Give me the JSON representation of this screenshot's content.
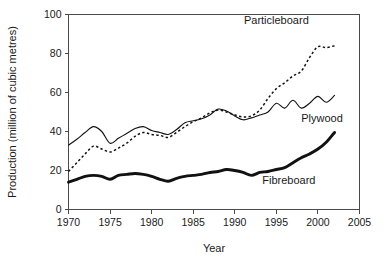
{
  "chart_data": {
    "type": "line",
    "title": "",
    "xlabel": "Year",
    "ylabel": "Production (million of cubic metres)",
    "xlim": [
      1970,
      2005
    ],
    "ylim": [
      0,
      100
    ],
    "grid": false,
    "legend_position": "inline-annotations",
    "xticks": [
      1970,
      1975,
      1980,
      1985,
      1990,
      1995,
      2000,
      2005
    ],
    "yticks": [
      0,
      20,
      40,
      60,
      80,
      100
    ],
    "x": [
      1970,
      1971,
      1972,
      1973,
      1974,
      1975,
      1976,
      1977,
      1978,
      1979,
      1980,
      1981,
      1982,
      1983,
      1984,
      1985,
      1986,
      1987,
      1988,
      1989,
      1990,
      1991,
      1992,
      1993,
      1994,
      1995,
      1996,
      1997,
      1998,
      1999,
      2000,
      2001,
      2002
    ],
    "series": [
      {
        "name": "Particleboard",
        "style": "dotted",
        "color": "#111111",
        "values": [
          19.5,
          24.0,
          28.5,
          32.5,
          31.0,
          29.5,
          31.5,
          34.0,
          37.5,
          39.5,
          38.5,
          38.0,
          37.0,
          39.5,
          42.5,
          45.0,
          47.0,
          49.5,
          51.0,
          50.0,
          48.5,
          47.5,
          48.0,
          51.0,
          57.0,
          62.0,
          65.0,
          68.5,
          71.0,
          78.0,
          83.5,
          83.0,
          84.0
        ]
      },
      {
        "name": "Plywood",
        "style": "thin-solid",
        "color": "#111111",
        "values": [
          33.0,
          36.0,
          39.5,
          42.5,
          40.0,
          34.0,
          36.5,
          39.0,
          41.5,
          42.5,
          40.5,
          39.5,
          38.5,
          41.0,
          44.5,
          45.5,
          46.5,
          48.5,
          51.5,
          50.5,
          48.0,
          46.0,
          47.0,
          48.5,
          50.0,
          54.5,
          52.0,
          56.0,
          52.0,
          54.5,
          58.0,
          55.0,
          58.5
        ]
      },
      {
        "name": "Fibreboard",
        "style": "thick-solid",
        "color": "#111111",
        "values": [
          14.0,
          15.5,
          17.0,
          17.5,
          17.0,
          15.5,
          17.5,
          18.0,
          18.5,
          18.0,
          17.0,
          15.5,
          14.5,
          16.0,
          17.0,
          17.5,
          18.0,
          19.0,
          19.5,
          20.5,
          20.0,
          19.0,
          17.5,
          19.0,
          19.5,
          20.5,
          21.5,
          24.0,
          26.5,
          28.5,
          31.0,
          34.5,
          39.5
        ]
      }
    ],
    "annotations": [
      {
        "text": "Particleboard",
        "x": 1995.0,
        "y": 95.0
      },
      {
        "text": "Plywood",
        "x": 2000.5,
        "y": 45.0
      },
      {
        "text": "Fibreboard",
        "x": 1996.5,
        "y": 13.0
      }
    ]
  }
}
